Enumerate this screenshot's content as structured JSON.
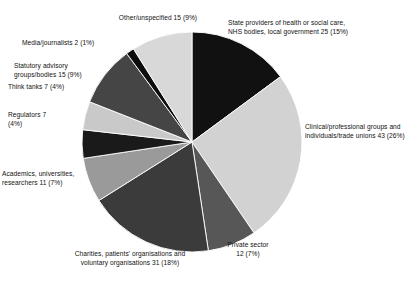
{
  "chart_data": {
    "type": "pie",
    "title": "",
    "subtitle": "",
    "xlabel": "",
    "ylabel": "",
    "legend_position": "none",
    "grid": false,
    "total": 168,
    "start_angle_deg": 0,
    "direction": "clockwise",
    "categories": [
      "State providers of health or social care, NHS bodies, local government",
      "Clinical/professional groups and individuals/trade unions",
      "Private sector",
      "Charities, patients' organisations and voluntary organisations",
      "Academics, universities, researchers",
      "Regulators",
      "Think tanks",
      "Statutory advisory groups/bodies",
      "Media/journalists",
      "Other/unspecified"
    ],
    "values": [
      25,
      43,
      12,
      31,
      11,
      7,
      7,
      15,
      2,
      15
    ],
    "percents": [
      15,
      26,
      7,
      18,
      7,
      4,
      4,
      9,
      1,
      9
    ],
    "colors": [
      "#111111",
      "#d2d2d2",
      "#575757",
      "#3b3b3b",
      "#9a9a9a",
      "#1a1a1a",
      "#c9c9c9",
      "#454545",
      "#0d0d0d",
      "#d8d8d8"
    ],
    "slices": [
      {
        "name": "state-providers",
        "label": "State providers of health or social care,\nNHS bodies, local government 25 (15%)",
        "value": 25,
        "percent": 15,
        "color": "#111111"
      },
      {
        "name": "clinical-professional",
        "label": "Clinical/professional groups and\nindividuals/trade unions 43 (26%)",
        "value": 43,
        "percent": 26,
        "color": "#d2d2d2"
      },
      {
        "name": "private-sector",
        "label": "Private sector\n12 (7%)",
        "value": 12,
        "percent": 7,
        "color": "#575757"
      },
      {
        "name": "charities-patients-voluntary",
        "label": "Charities, patients' organisations and\nvoluntary organisations 31 (18%)",
        "value": 31,
        "percent": 18,
        "color": "#3b3b3b"
      },
      {
        "name": "academics-universities-researchers",
        "label": "Academics, universities,\nresearchers 11 (7%)",
        "value": 11,
        "percent": 7,
        "color": "#9a9a9a"
      },
      {
        "name": "regulators",
        "label": "Regulators 7\n(4%)",
        "value": 7,
        "percent": 4,
        "color": "#1a1a1a"
      },
      {
        "name": "think-tanks",
        "label": "Think tanks 7 (4%)",
        "value": 7,
        "percent": 4,
        "color": "#c9c9c9"
      },
      {
        "name": "statutory-advisory",
        "label": "Statutory advisory\ngroups/bodies 15 (9%)",
        "value": 15,
        "percent": 9,
        "color": "#454545"
      },
      {
        "name": "media-journalists",
        "label": "Media/journalists 2 (1%)",
        "value": 2,
        "percent": 1,
        "color": "#0d0d0d"
      },
      {
        "name": "other-unspecified",
        "label": "Other/unspecified 15 (9%)",
        "value": 15,
        "percent": 9,
        "color": "#d8d8d8"
      }
    ]
  },
  "labels": {
    "state_providers": "State providers of health or social care,\nNHS bodies, local government 25 (15%)",
    "clinical_professional": "Clinical/professional groups and\nindividuals/trade unions 43 (26%)",
    "private_sector": "Private sector\n12 (7%)",
    "charities": "Charities, patients' organisations and\nvoluntary organisations 31 (18%)",
    "academics": "Academics, universities,\nresearchers 11 (7%)",
    "regulators": "Regulators 7\n(4%)",
    "think_tanks": "Think tanks 7 (4%)",
    "statutory_advisory": "Statutory advisory\ngroups/bodies 15 (9%)",
    "media_journalists": "Media/journalists 2 (1%)",
    "other_unspecified": "Other/unspecified 15 (9%)"
  },
  "geometry": {
    "cx": 192,
    "cy": 142,
    "r": 110
  }
}
